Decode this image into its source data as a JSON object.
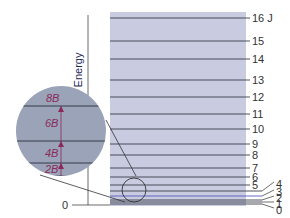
{
  "axis": {
    "ylabel": "Energy",
    "zero_label": "0"
  },
  "panel": {
    "bg": "#c9cbe0",
    "line_color": "#3a3f4a",
    "x0": 110,
    "x1": 246
  },
  "levels": [
    {
      "J": 16,
      "label": "16 J",
      "y": 18
    },
    {
      "J": 15,
      "label": "15",
      "y": 41
    },
    {
      "J": 14,
      "label": "14",
      "y": 59
    },
    {
      "J": 13,
      "label": "13",
      "y": 80
    },
    {
      "J": 12,
      "label": "12",
      "y": 97
    },
    {
      "J": 11,
      "label": "11",
      "y": 114
    },
    {
      "J": 10,
      "label": "10",
      "y": 129
    },
    {
      "J": 9,
      "label": "9",
      "y": 144
    },
    {
      "J": 8,
      "label": "8",
      "y": 155
    },
    {
      "J": 7,
      "label": "7",
      "y": 168
    },
    {
      "J": 6,
      "label": "6",
      "y": 177
    },
    {
      "J": 5,
      "label": "5",
      "y": 185
    },
    {
      "J": 4,
      "label": "4",
      "y": 191
    },
    {
      "J": 3,
      "label": "3",
      "y": 196
    },
    {
      "J": 2,
      "label": "2",
      "y": 200
    },
    {
      "J": 1,
      "label": "1",
      "y": 202
    },
    {
      "J": 0,
      "label": "0",
      "y": 204
    }
  ],
  "inset": {
    "bg": "#9aa3b8",
    "spacing_labels": [
      "8B",
      "6B",
      "4B",
      "2B"
    ],
    "arrow_color": "#8a2a5a"
  }
}
